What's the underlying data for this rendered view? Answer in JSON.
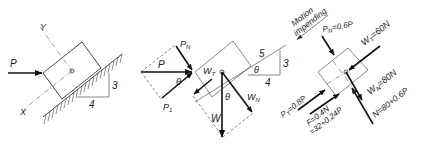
{
  "figure": {
    "slope": {
      "rise": "3",
      "run": "4",
      "hyp": "5"
    },
    "panel_a": {
      "force_label": "P",
      "axis_x": "X",
      "axis_y": "Y",
      "slope_rise": "3",
      "slope_run": "4"
    },
    "panel_b": {
      "force_label": "P",
      "pn_label": "P",
      "pn_sub": "N",
      "pt_label": "P",
      "pt_sub": "1",
      "theta1": "θ",
      "theta2": "θ",
      "theta3": "θ",
      "w_label": "W",
      "wt_label": "W",
      "wt_sub": "T",
      "wn_label": "W",
      "wn_sub": "N",
      "tri_hyp": "5",
      "tri_rise": "3",
      "tri_run": "4"
    },
    "panel_c": {
      "motion_line1": "Motion",
      "motion_line2": "impending",
      "pn_label": "P",
      "pn_sub": "N",
      "pn_value": "=0.6P",
      "wt_label": "W",
      "wt_sub": "T",
      "wt_value": "=60N",
      "wn_label": "W",
      "wn_sub": "N",
      "wn_value": "=80N",
      "pt_label": "P",
      "pt_sub": "T",
      "pt_value": "=0.8P",
      "f_line1": "F=0.4N",
      "f_line2": "=32+0.24P",
      "n_value": "N=80+0.6P"
    }
  }
}
